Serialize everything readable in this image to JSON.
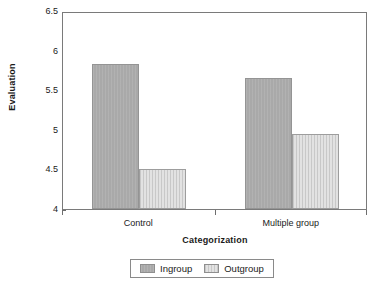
{
  "chart_data": {
    "type": "bar",
    "title": "",
    "subtitle": "",
    "xlabel": "Categorization",
    "ylabel": "Evaluation",
    "categories": [
      "Control",
      "Multiple group"
    ],
    "series": [
      {
        "name": "Ingroup",
        "values": [
          5.83,
          5.66
        ],
        "color": "#a9a9a9"
      },
      {
        "name": "Outgroup",
        "values": [
          4.5,
          4.95
        ],
        "color": "#e2e2e2"
      }
    ],
    "ylim": [
      4,
      6.5
    ],
    "yticks": [
      4,
      4.5,
      5,
      5.5,
      6,
      6.5
    ],
    "ytick_labels": [
      "4",
      "4.5",
      "5",
      "5.5",
      "6",
      "6.5"
    ],
    "grid": false,
    "legend_position": "bottom",
    "legend_entries": [
      "Ingroup",
      "Outgroup"
    ]
  },
  "axes": {
    "y_title": "Evaluation",
    "x_title": "Categorization"
  },
  "legend": {
    "items": [
      {
        "label": "Ingroup"
      },
      {
        "label": "Outgroup"
      }
    ]
  },
  "colors": {
    "ingroup": "#a9a9a9",
    "outgroup": "#e2e2e2",
    "axis": "#7a7a7a",
    "text": "#1a1a1a",
    "background": "#ffffff"
  }
}
